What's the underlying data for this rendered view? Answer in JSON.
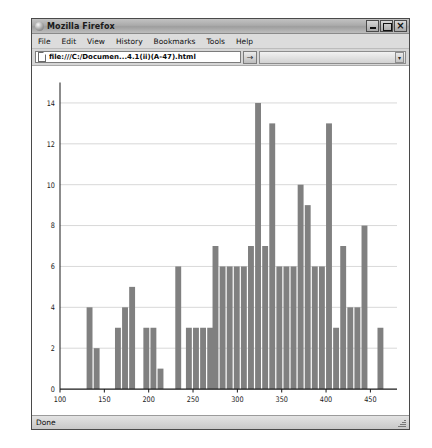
{
  "window": {
    "title": "Mozilla Firefox",
    "logo_icon": "firefox-logo-icon",
    "controls": {
      "minimize": "minimize-icon",
      "maximize": "maximize-icon",
      "close": "×"
    }
  },
  "menubar": {
    "items": [
      {
        "label": "File"
      },
      {
        "label": "Edit"
      },
      {
        "label": "View"
      },
      {
        "label": "History"
      },
      {
        "label": "Bookmarks"
      },
      {
        "label": "Tools"
      },
      {
        "label": "Help"
      }
    ]
  },
  "navbar": {
    "page_icon": "page-document-icon",
    "url_value": "file:///C:/Documen...4.1(ii)(A-47).html",
    "url_placeholder": "",
    "go_button_label": "→",
    "search_value": "",
    "search_placeholder": "",
    "search_dropdown_icon": "chevron-down-icon"
  },
  "statusbar": {
    "text": "Done",
    "resize_grip_icon": "resize-grip-icon"
  },
  "colors": {
    "bar_fill": "#808080",
    "axis": "#1a1a1a",
    "grid": "#d2d2d2",
    "plot_bg": "#ffffff"
  },
  "chart_data": {
    "type": "bar",
    "title": "",
    "xlabel": "",
    "ylabel": "",
    "xlim": [
      100,
      480
    ],
    "ylim": [
      0,
      15
    ],
    "xticks": [
      100,
      150,
      200,
      250,
      300,
      350,
      400,
      450
    ],
    "yticks": [
      0,
      2,
      4,
      6,
      8,
      10,
      12,
      14
    ],
    "grid": true,
    "legend": null,
    "bin_width": 8,
    "bins": [
      {
        "x": 134,
        "value": 4
      },
      {
        "x": 142,
        "value": 2
      },
      {
        "x": 166,
        "value": 3
      },
      {
        "x": 174,
        "value": 4
      },
      {
        "x": 182,
        "value": 5
      },
      {
        "x": 198,
        "value": 3
      },
      {
        "x": 206,
        "value": 3
      },
      {
        "x": 214,
        "value": 1
      },
      {
        "x": 234,
        "value": 6
      },
      {
        "x": 246,
        "value": 3
      },
      {
        "x": 254,
        "value": 3
      },
      {
        "x": 262,
        "value": 3
      },
      {
        "x": 270,
        "value": 3
      },
      {
        "x": 276,
        "value": 7
      },
      {
        "x": 284,
        "value": 6
      },
      {
        "x": 292,
        "value": 6
      },
      {
        "x": 300,
        "value": 6
      },
      {
        "x": 308,
        "value": 6
      },
      {
        "x": 316,
        "value": 7
      },
      {
        "x": 324,
        "value": 14
      },
      {
        "x": 332,
        "value": 7
      },
      {
        "x": 340,
        "value": 13
      },
      {
        "x": 348,
        "value": 6
      },
      {
        "x": 356,
        "value": 6
      },
      {
        "x": 364,
        "value": 6
      },
      {
        "x": 372,
        "value": 10
      },
      {
        "x": 380,
        "value": 9
      },
      {
        "x": 388,
        "value": 6
      },
      {
        "x": 396,
        "value": 6
      },
      {
        "x": 404,
        "value": 13
      },
      {
        "x": 412,
        "value": 3
      },
      {
        "x": 420,
        "value": 7
      },
      {
        "x": 428,
        "value": 4
      },
      {
        "x": 436,
        "value": 4
      },
      {
        "x": 444,
        "value": 8
      },
      {
        "x": 462,
        "value": 3
      }
    ]
  }
}
